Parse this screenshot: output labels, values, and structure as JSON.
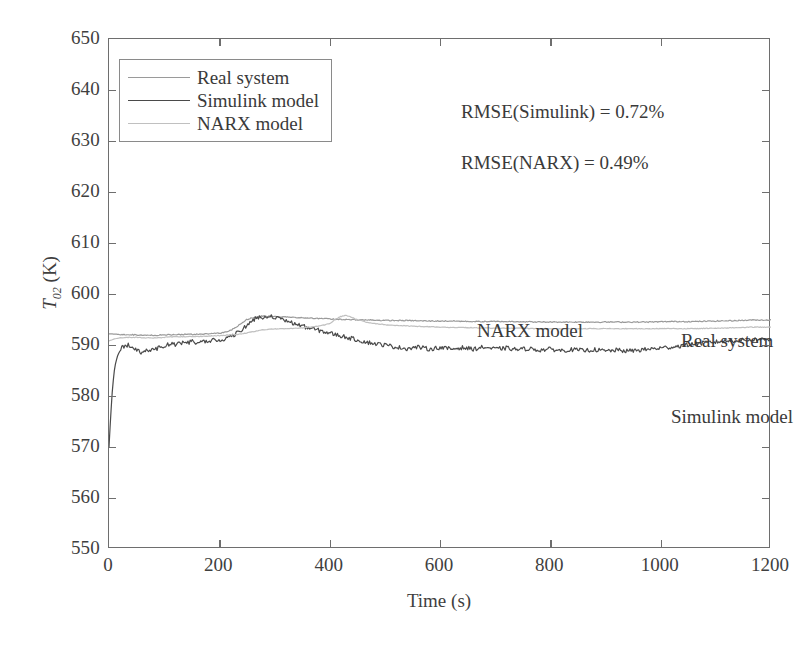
{
  "corner_tag": "M2",
  "annotations": {
    "rmse_simulink": "RMSE(Simulink) = 0.72%",
    "rmse_narx": "RMSE(NARX) = 0.49%",
    "curve_narx": "NARX model",
    "curve_real": "Real system",
    "curve_simulink": "Simulink model"
  },
  "legend": {
    "items": [
      {
        "label": "Real system",
        "color": "#9a9a9a"
      },
      {
        "label": "Simulink model",
        "color": "#4a4a4a"
      },
      {
        "label": "NARX model",
        "color": "#c0c0c0"
      }
    ]
  },
  "axes": {
    "y_title_main": "T",
    "y_title_sub": "02",
    "y_title_unit": " (K)",
    "x_title": "Time (s)",
    "y_ticks": [
      "550",
      "560",
      "570",
      "580",
      "590",
      "600",
      "610",
      "620",
      "630",
      "640",
      "650"
    ],
    "x_ticks": [
      "0",
      "200",
      "400",
      "600",
      "800",
      "1000",
      "1200"
    ]
  },
  "chart_data": {
    "type": "line",
    "title": "",
    "subtitle": "",
    "xlabel": "Time (s)",
    "ylabel": "T_02 (K)",
    "xlim": [
      0,
      1200
    ],
    "ylim": [
      550,
      650
    ],
    "xtick_step": 200,
    "ytick_step": 10,
    "grid": false,
    "legend_position": "upper-left",
    "annotations": [
      {
        "text": "RMSE(Simulink) = 0.72%",
        "x": 440,
        "y": 642
      },
      {
        "text": "RMSE(NARX) = 0.49%",
        "x": 440,
        "y": 632
      },
      {
        "text": "M2",
        "x": 1165,
        "y": 645
      },
      {
        "text": "NARX model",
        "x": 470,
        "y": 601
      },
      {
        "text": "Real system",
        "x": 840,
        "y": 599
      },
      {
        "text": "Simulink model",
        "x": 820,
        "y": 584
      }
    ],
    "series": [
      {
        "name": "Real system",
        "color": "#9a9a9a",
        "linewidth": 1.2,
        "x": [
          0,
          15,
          30,
          45,
          60,
          80,
          100,
          120,
          140,
          160,
          180,
          200,
          215,
          230,
          240,
          250,
          260,
          270,
          280,
          300,
          320,
          340,
          360,
          380,
          400,
          420,
          440,
          460,
          480,
          500,
          540,
          580,
          620,
          660,
          700,
          740,
          780,
          820,
          860,
          900,
          940,
          980,
          1020,
          1060,
          1100,
          1140,
          1170
        ],
        "y": [
          592.2,
          592.1,
          592.0,
          592.0,
          591.9,
          591.9,
          592.0,
          592.0,
          592.1,
          592.1,
          592.2,
          592.3,
          592.6,
          593.4,
          594.3,
          595.0,
          595.4,
          595.6,
          595.7,
          595.6,
          595.5,
          595.4,
          595.3,
          595.2,
          595.1,
          595.0,
          595.0,
          594.9,
          594.9,
          594.8,
          594.8,
          594.7,
          594.7,
          594.6,
          594.6,
          594.6,
          594.5,
          594.5,
          594.5,
          594.5,
          594.5,
          594.5,
          594.6,
          594.6,
          594.7,
          594.8,
          594.9
        ]
      },
      {
        "name": "Simulink model",
        "color": "#4a4a4a",
        "linewidth": 1.2,
        "x": [
          0,
          3,
          6,
          9,
          12,
          16,
          20,
          25,
          30,
          36,
          42,
          50,
          58,
          66,
          74,
          82,
          90,
          100,
          110,
          120,
          130,
          140,
          150,
          160,
          170,
          180,
          190,
          200,
          210,
          220,
          230,
          240,
          250,
          258,
          266,
          274,
          282,
          290,
          300,
          312,
          324,
          336,
          348,
          360,
          375,
          390,
          405,
          420,
          435,
          450,
          465,
          480,
          500,
          520,
          540,
          560,
          580,
          600,
          620,
          640,
          660,
          680,
          700,
          720,
          740,
          760,
          780,
          800,
          820,
          840,
          860,
          880,
          900,
          920,
          940,
          960,
          980,
          1000,
          1020,
          1040,
          1060,
          1080,
          1100,
          1120,
          1140,
          1160,
          1170
        ],
        "y": [
          570.0,
          576.0,
          581.0,
          584.5,
          586.5,
          588.0,
          589.0,
          589.6,
          589.9,
          590.0,
          589.8,
          589.0,
          588.4,
          588.8,
          589.2,
          589.0,
          589.4,
          589.9,
          590.2,
          590.1,
          590.5,
          590.3,
          590.7,
          590.5,
          590.8,
          590.6,
          591.0,
          590.8,
          591.2,
          591.6,
          592.2,
          593.0,
          593.8,
          594.6,
          595.2,
          595.6,
          595.4,
          595.8,
          595.4,
          595.0,
          594.6,
          594.2,
          593.8,
          593.4,
          593.0,
          592.6,
          592.2,
          591.8,
          591.4,
          591.0,
          590.6,
          590.3,
          590.0,
          589.6,
          589.3,
          589.6,
          589.2,
          589.5,
          589.2,
          589.5,
          589.2,
          589.6,
          589.2,
          589.4,
          589.1,
          589.3,
          589.0,
          589.2,
          588.9,
          589.1,
          588.9,
          589.1,
          588.8,
          589.0,
          588.8,
          589.0,
          589.2,
          589.4,
          589.6,
          589.9,
          590.2,
          590.4,
          590.6,
          590.8,
          590.9,
          591.0,
          591.1
        ]
      },
      {
        "name": "NARX model",
        "color": "#c0c0c0",
        "linewidth": 1.2,
        "x": [
          0,
          10,
          20,
          35,
          50,
          70,
          90,
          110,
          130,
          150,
          170,
          190,
          210,
          225,
          240,
          250,
          260,
          270,
          280,
          295,
          310,
          325,
          340,
          355,
          370,
          385,
          400,
          410,
          420,
          430,
          440,
          455,
          470,
          490,
          510,
          530,
          550,
          575,
          600,
          630,
          660,
          700,
          740,
          780,
          820,
          860,
          900,
          940,
          980,
          1020,
          1060,
          1100,
          1140,
          1170
        ],
        "y": [
          590.8,
          591.2,
          591.4,
          591.5,
          591.5,
          591.4,
          591.4,
          591.6,
          591.6,
          591.7,
          591.7,
          591.8,
          591.9,
          592.0,
          592.2,
          592.4,
          592.6,
          592.8,
          593.0,
          593.1,
          593.2,
          593.2,
          593.3,
          593.4,
          593.6,
          593.8,
          594.2,
          595.0,
          595.6,
          595.8,
          595.4,
          594.8,
          594.4,
          594.1,
          593.9,
          593.8,
          593.7,
          593.6,
          593.5,
          593.4,
          593.4,
          593.3,
          593.3,
          593.2,
          593.2,
          593.2,
          593.2,
          593.2,
          593.2,
          593.2,
          593.2,
          593.3,
          593.4,
          593.5
        ]
      }
    ]
  }
}
